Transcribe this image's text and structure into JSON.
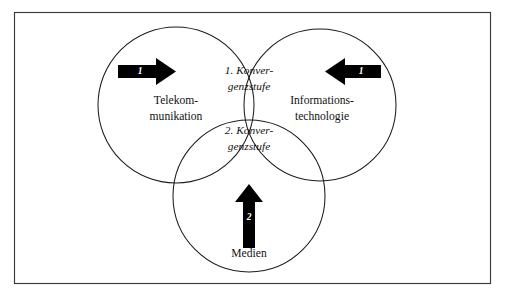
{
  "figure": {
    "frame": {
      "stroke_color": "#3a3a3a"
    },
    "background_color": "#ffffff",
    "line_color": "#1c1c1c",
    "arrow_color": "#000000"
  },
  "circles": [
    {
      "id": "telekommunikation",
      "label_line1": "Telekom-",
      "label_line2": "munikation",
      "cx": 176,
      "cy": 105,
      "r": 78
    },
    {
      "id": "informationstechnologie",
      "label_line1": "Informations-",
      "label_line2": "technologie",
      "cx": 320,
      "cy": 105,
      "r": 76
    },
    {
      "id": "medien",
      "label_line1": "Medien",
      "label_line2": "",
      "cx": 249,
      "cy": 196,
      "r": 76
    }
  ],
  "overlaps": [
    {
      "id": "erste-konvergenzstufe",
      "line1": "1. Konver-",
      "line2": "genzstufe",
      "x": 249,
      "y": 78
    },
    {
      "id": "zweite-konvergenzstufe",
      "line1": "2. Konver-",
      "line2": "genzstufe",
      "x": 249,
      "y": 137
    }
  ],
  "arrows": [
    {
      "id": "arrow-left-to-right",
      "number": "1",
      "direction": "right",
      "x": 118,
      "y": 62,
      "width": 58,
      "height": 19
    },
    {
      "id": "arrow-right-to-left",
      "number": "1",
      "direction": "left",
      "x": 325,
      "y": 62,
      "width": 56,
      "height": 19
    },
    {
      "id": "arrow-bottom-up",
      "number": "2",
      "direction": "up",
      "x": 240,
      "y": 190,
      "width": 20,
      "height": 58
    }
  ]
}
